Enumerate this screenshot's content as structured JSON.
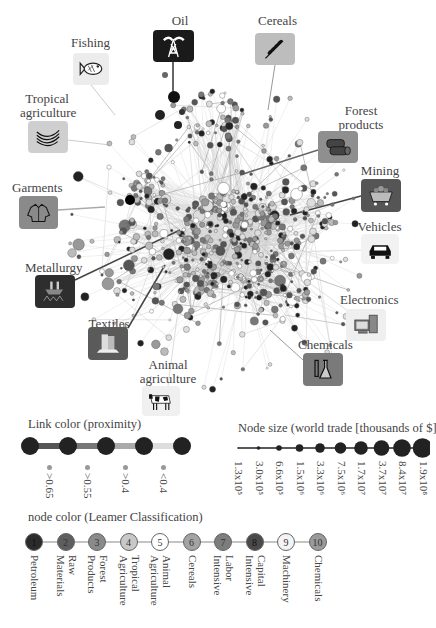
{
  "categories": [
    {
      "id": "oil",
      "label": "Oil",
      "icon": "oil-derrick-icon",
      "box_color": "#1a1a1a"
    },
    {
      "id": "fishing",
      "label": "Fishing",
      "icon": "fish-icon",
      "box_color": "#e6e6e6"
    },
    {
      "id": "cereals",
      "label": "Cereals",
      "icon": "wheat-icon",
      "box_color": "#bdbdbd"
    },
    {
      "id": "tropical",
      "label": "Tropical\nagriculture",
      "label_line1": "Tropical",
      "label_line2": "agriculture",
      "icon": "bananas-icon",
      "box_color": "#cfcfcf"
    },
    {
      "id": "forest",
      "label": "Forest\nproducts",
      "label_line1": "Forest",
      "label_line2": "products",
      "icon": "logs-icon",
      "box_color": "#8f8f8f"
    },
    {
      "id": "garments",
      "label": "Garments",
      "icon": "jacket-icon",
      "box_color": "#8a8a8a"
    },
    {
      "id": "mining",
      "label": "Mining",
      "icon": "mine-cart-icon",
      "box_color": "#555555"
    },
    {
      "id": "vehicles",
      "label": "Vehicles",
      "icon": "car-icon",
      "box_color": "#f2f2f2"
    },
    {
      "id": "metallurgy",
      "label": "Metallurgy",
      "icon": "furnace-icon",
      "box_color": "#2e2e2e"
    },
    {
      "id": "textiles",
      "label": "Textiles",
      "icon": "fabric-rolls-icon",
      "box_color": "#5a5a5a"
    },
    {
      "id": "electronics",
      "label": "Electronics",
      "icon": "computer-icon",
      "box_color": "#efefef"
    },
    {
      "id": "chemicals",
      "label": "Chemicals",
      "icon": "flask-icon",
      "box_color": "#7a7a7a"
    },
    {
      "id": "animal",
      "label": "Animal\nagriculture",
      "label_line1": "Animal",
      "label_line2": "agriculture",
      "icon": "cow-icon",
      "box_color": "#f0f0f0"
    }
  ],
  "link_legend": {
    "title": "Link color (proximity)",
    "items": [
      {
        "label": ">0.65",
        "color": "#555555"
      },
      {
        "label": ">0.55",
        "color": "#777777"
      },
      {
        "label": ">0.4",
        "color": "#aaaaaa"
      },
      {
        "label": "<0.4",
        "color": "#dddddd"
      }
    ]
  },
  "size_legend": {
    "title": "Node size (world trade [thousands of $])",
    "items": [
      "1.3x10⁵",
      "3.0x10⁵",
      "6.6x10⁵",
      "1.5x10⁶",
      "3.3x10⁶",
      "7.5x10⁶",
      "1.7x10⁷",
      "3.7x10⁷",
      "8.4x10⁷",
      "1.9x10⁸"
    ]
  },
  "color_legend": {
    "title": "node color (Leamer Classification)",
    "items": [
      {
        "num": "1",
        "label1": "Petroleum",
        "label2": "",
        "color": "#2b2b2b"
      },
      {
        "num": "2",
        "label1": "Raw",
        "label2": "Materials",
        "color": "#5e5e5e"
      },
      {
        "num": "3",
        "label1": "Forest",
        "label2": "Products",
        "color": "#8a8a8a"
      },
      {
        "num": "4",
        "label1": "Tropical",
        "label2": "Agriculture",
        "color": "#c8c8c8"
      },
      {
        "num": "5",
        "label1": "Animal",
        "label2": "Agriculture",
        "color": "#ffffff"
      },
      {
        "num": "6",
        "label1": "Cereals",
        "label2": "",
        "color": "#a3a3a3"
      },
      {
        "num": "7",
        "label1": "Labor",
        "label2": "Intensive",
        "color": "#7d7d7d"
      },
      {
        "num": "8",
        "label1": "Capital",
        "label2": "Intensive",
        "color": "#4a4a4a"
      },
      {
        "num": "9",
        "label1": "Machinery",
        "label2": "",
        "color": "#f4f4f4"
      },
      {
        "num": "10",
        "label1": "Chemicals",
        "label2": "",
        "color": "#9a9a9a"
      }
    ]
  }
}
